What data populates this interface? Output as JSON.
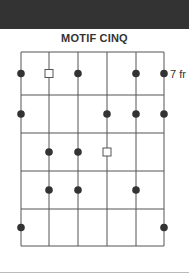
{
  "title": "MOTIF CINQ",
  "fret_label": "7 fr",
  "colors": {
    "header_bar": "#333333",
    "grid": "#555555",
    "dot": "#333333"
  },
  "grid": {
    "strings_x": [
      21,
      49,
      78,
      107,
      136,
      164
    ],
    "frets_y": [
      52,
      95,
      133,
      171,
      209,
      246
    ]
  },
  "markers": [
    {
      "row": 1,
      "string": 1,
      "type": "dot"
    },
    {
      "row": 1,
      "string": 2,
      "type": "square"
    },
    {
      "row": 1,
      "string": 3,
      "type": "dot"
    },
    {
      "row": 1,
      "string": 5,
      "type": "dot"
    },
    {
      "row": 1,
      "string": 6,
      "type": "dot"
    },
    {
      "row": 2,
      "string": 1,
      "type": "dot"
    },
    {
      "row": 2,
      "string": 4,
      "type": "dot"
    },
    {
      "row": 2,
      "string": 5,
      "type": "dot"
    },
    {
      "row": 2,
      "string": 6,
      "type": "dot"
    },
    {
      "row": 3,
      "string": 2,
      "type": "dot"
    },
    {
      "row": 3,
      "string": 3,
      "type": "dot"
    },
    {
      "row": 3,
      "string": 4,
      "type": "square"
    },
    {
      "row": 4,
      "string": 2,
      "type": "dot"
    },
    {
      "row": 4,
      "string": 3,
      "type": "dot"
    },
    {
      "row": 4,
      "string": 5,
      "type": "dot"
    },
    {
      "row": 5,
      "string": 1,
      "type": "dot"
    },
    {
      "row": 5,
      "string": 6,
      "type": "dot"
    }
  ]
}
